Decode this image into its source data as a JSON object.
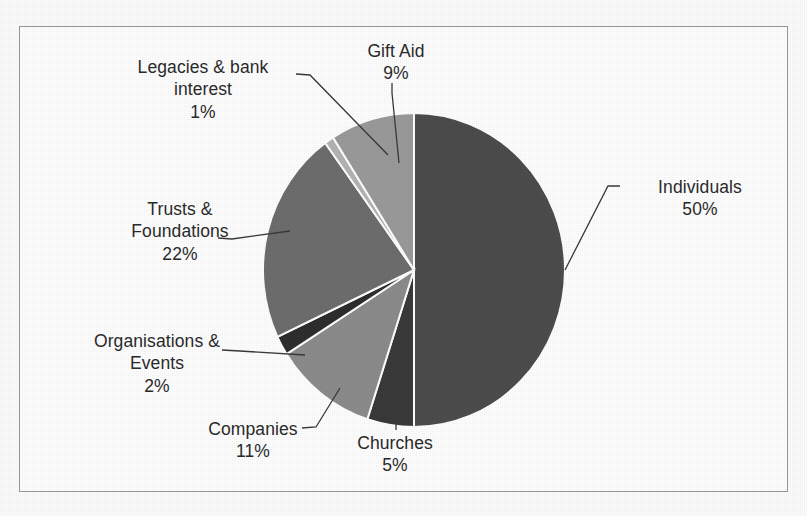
{
  "chart_data": {
    "type": "pie",
    "title": "",
    "subtitle": "",
    "legend_position": "none",
    "labels_outside": true,
    "start_angle_deg": 0,
    "direction": "clockwise",
    "categories": [
      "Individuals",
      "Churches",
      "Companies",
      "Organisations & Events",
      "Trusts & Foundations",
      "Legacies & bank interest",
      "Gift Aid"
    ],
    "values": [
      50,
      5,
      11,
      2,
      22,
      1,
      9
    ],
    "value_labels": [
      "50%",
      "5%",
      "11%",
      "2%",
      "22%",
      "1%",
      "9%"
    ],
    "units": "percent",
    "total": 100,
    "slice_colors": [
      "#4d4d4d",
      "#3a3a3a",
      "#8c8c8c",
      "#2e2e2e",
      "#6e6e6e",
      "#b4b4b4",
      "#9b9b9b"
    ],
    "slice_separator_color": "#ffffff"
  },
  "frame": {
    "border_color": "#9a9a9a",
    "background": "#ffffff"
  },
  "labels": {
    "individuals": {
      "name": "Individuals",
      "pct": "50%"
    },
    "churches": {
      "name": "Churches",
      "pct": "5%"
    },
    "companies": {
      "name": "Companies",
      "pct": "11%"
    },
    "organisations": {
      "name_line1": "Organisations &",
      "name_line2": "Events",
      "pct": "2%"
    },
    "trusts": {
      "name_line1": "Trusts &",
      "name_line2": "Foundations",
      "pct": "22%"
    },
    "legacies": {
      "name_line1": "Legacies & bank",
      "name_line2": "interest",
      "pct": "1%"
    },
    "giftaid": {
      "name": "Gift Aid",
      "pct": "9%"
    }
  }
}
